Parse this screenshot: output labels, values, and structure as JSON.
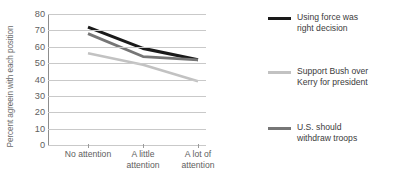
{
  "chart_data": {
    "type": "line",
    "title": "",
    "xlabel": "",
    "ylabel": "Percent agreein with each position",
    "categories": [
      "No attention",
      "A little attention",
      "A lot of attention"
    ],
    "category_lines": [
      [
        "No attention"
      ],
      [
        "A little",
        "attention"
      ],
      [
        "A lot of",
        "attention"
      ]
    ],
    "ylim": [
      0,
      80
    ],
    "yticks": [
      80,
      70,
      60,
      50,
      40,
      30,
      20,
      10,
      0
    ],
    "ytick_labels": [
      "80",
      "70",
      "60",
      "50",
      "40",
      "30",
      "20",
      "10",
      "0"
    ],
    "grid": true,
    "legend_position": "right",
    "series": [
      {
        "name": "Using force was right decision",
        "name_lines": [
          "Using force was",
          "right decision"
        ],
        "color": "#1a1a1a",
        "width": 3.1,
        "values": [
          72,
          59,
          52
        ]
      },
      {
        "name": "Support Bush over Kerry for president",
        "name_lines": [
          "Support Bush over",
          "Kerry for president"
        ],
        "color": "#c2c2c2",
        "width": 2.6,
        "values": [
          56,
          49,
          39
        ]
      },
      {
        "name": "U.S. should withdraw troops",
        "name_lines": [
          "U.S. should",
          "withdraw troops"
        ],
        "color": "#767676",
        "width": 2.8,
        "values": [
          68,
          54,
          52
        ]
      }
    ]
  },
  "axis": {
    "y_title": "Percent agreein with each position"
  },
  "colors": {
    "gridline": "#c9c9c9",
    "axis": "#8d8d8d",
    "tick_text": "#5e5e5e",
    "legend_text": "#3b3b3b",
    "background": "#ffffff"
  }
}
